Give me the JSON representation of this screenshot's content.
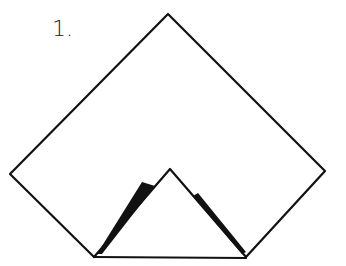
{
  "diagram": {
    "step_label": "1.",
    "stroke_color": "#111111",
    "background": "#ffffff",
    "outer_shape": {
      "points": [
        [
          168,
          14
        ],
        [
          325,
          171
        ],
        [
          246,
          257
        ],
        [
          94,
          257
        ],
        [
          10,
          174
        ]
      ]
    },
    "inner_triangle": {
      "points": [
        [
          94,
          257
        ],
        [
          170,
          169
        ],
        [
          246,
          257
        ]
      ]
    }
  }
}
